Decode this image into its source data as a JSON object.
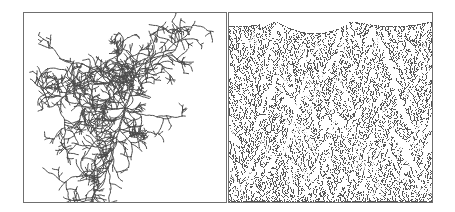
{
  "figure": {
    "panels": [
      {
        "id": "radial-aggregate",
        "description": "Radial diffusion-limited aggregate with four main arms",
        "seed": 7,
        "center": [
          101,
          95
        ],
        "color": "#4a4a4a"
      },
      {
        "id": "deposition-forest",
        "description": "Deposition growth from bottom edge forming dense tree-like columns",
        "seed": 13,
        "color": "#555555"
      }
    ],
    "colors": {
      "background": "#ffffff",
      "border": "#6f6f6f",
      "ink": "#4d4d4d"
    }
  }
}
